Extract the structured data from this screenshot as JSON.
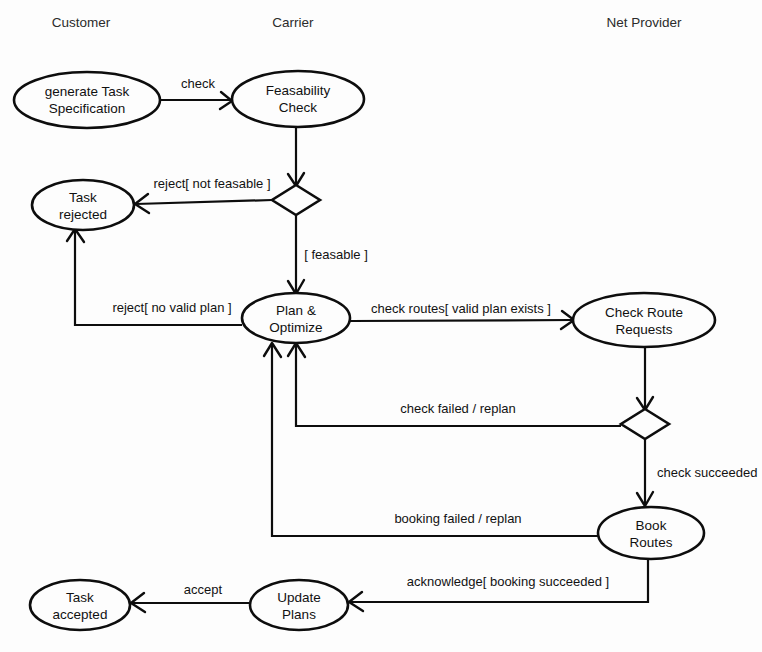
{
  "diagram": {
    "type": "uml-activity-state-diagram",
    "background_color": "#fdfdfd",
    "line_color": "#0d0d0d",
    "text_color": "#111111"
  },
  "lanes": [
    {
      "id": "lane-customer",
      "label": "Customer",
      "x": 81,
      "y": 27
    },
    {
      "id": "lane-carrier",
      "label": "Carrier",
      "x": 293,
      "y": 27
    },
    {
      "id": "lane-netprovider",
      "label": "Net Provider",
      "x": 644,
      "y": 27
    }
  ],
  "nodes": [
    {
      "id": "generate-task-specification",
      "shape": "ellipse",
      "lines": [
        "generate Task",
        "Specification"
      ],
      "cx": 87,
      "cy": 100,
      "rx": 73,
      "ry": 28
    },
    {
      "id": "feasability-check",
      "shape": "ellipse",
      "lines": [
        "Feasability",
        "Check"
      ],
      "cx": 298,
      "cy": 99,
      "rx": 66,
      "ry": 28
    },
    {
      "id": "task-rejected",
      "shape": "ellipse",
      "lines": [
        "Task",
        "rejected"
      ],
      "cx": 83,
      "cy": 205,
      "rx": 51,
      "ry": 25
    },
    {
      "id": "plan-and-optimize",
      "shape": "ellipse",
      "lines": [
        "Plan &",
        "Optimize"
      ],
      "cx": 296,
      "cy": 318,
      "rx": 54,
      "ry": 25
    },
    {
      "id": "check-route-requests",
      "shape": "ellipse",
      "lines": [
        "Check Route",
        "Requests"
      ],
      "cx": 644,
      "cy": 320,
      "rx": 71,
      "ry": 27
    },
    {
      "id": "book-routes",
      "shape": "ellipse",
      "lines": [
        "Book",
        "Routes"
      ],
      "cx": 651,
      "cy": 533,
      "rx": 53,
      "ry": 26
    },
    {
      "id": "update-plans",
      "shape": "ellipse",
      "lines": [
        "Update",
        "Plans"
      ],
      "cx": 299,
      "cy": 605,
      "rx": 49,
      "ry": 25
    },
    {
      "id": "task-accepted",
      "shape": "ellipse",
      "lines": [
        "Task",
        "accepted"
      ],
      "cx": 80,
      "cy": 605,
      "rx": 50,
      "ry": 25
    }
  ],
  "decisions": [
    {
      "id": "feasability-decision",
      "cx": 296,
      "cy": 200,
      "rx": 24,
      "ry": 15
    },
    {
      "id": "route-check-decision",
      "cx": 645,
      "cy": 424,
      "rx": 24,
      "ry": 15
    }
  ],
  "edges": [
    {
      "id": "edge-check",
      "from": "generate-task-specification",
      "to": "feasability-check",
      "label": "check",
      "label_x": 198,
      "label_y": 88,
      "label_anchor": "middle"
    },
    {
      "id": "edge-feasability-to-decision",
      "from": "feasability-check",
      "to": "feasability-decision",
      "label": "",
      "label_x": 0,
      "label_y": 0,
      "label_anchor": "middle"
    },
    {
      "id": "edge-reject-not-feasable",
      "from": "feasability-decision",
      "to": "task-rejected",
      "label": "reject[ not feasable ]",
      "label_x": 212,
      "label_y": 188,
      "label_anchor": "middle"
    },
    {
      "id": "edge-feasable",
      "from": "feasability-decision",
      "to": "plan-and-optimize",
      "label": "[ feasable ]",
      "label_x": 336,
      "label_y": 259,
      "label_anchor": "middle"
    },
    {
      "id": "edge-reject-no-valid-plan",
      "from": "plan-and-optimize",
      "to": "task-rejected",
      "label": "reject[ no valid plan ]",
      "label_x": 172,
      "label_y": 312,
      "label_anchor": "middle"
    },
    {
      "id": "edge-check-routes",
      "from": "plan-and-optimize",
      "to": "check-route-requests",
      "label": "check routes[ valid plan exists ]",
      "label_x": 461,
      "label_y": 313,
      "label_anchor": "middle"
    },
    {
      "id": "edge-requests-to-decision",
      "from": "check-route-requests",
      "to": "route-check-decision",
      "label": "",
      "label_x": 0,
      "label_y": 0,
      "label_anchor": "middle"
    },
    {
      "id": "edge-check-failed-replan",
      "from": "route-check-decision",
      "to": "plan-and-optimize",
      "label": "check failed / replan",
      "label_x": 458,
      "label_y": 413,
      "label_anchor": "middle"
    },
    {
      "id": "edge-check-succeeded",
      "from": "route-check-decision",
      "to": "book-routes",
      "label": "check succeeded",
      "label_x": 657,
      "label_y": 477,
      "label_anchor": "start"
    },
    {
      "id": "edge-booking-failed-replan",
      "from": "book-routes",
      "to": "plan-and-optimize",
      "label": "booking failed / replan",
      "label_x": 458,
      "label_y": 523,
      "label_anchor": "middle"
    },
    {
      "id": "edge-acknowledge",
      "from": "book-routes",
      "to": "update-plans",
      "label": "acknowledge[ booking succeeded ]",
      "label_x": 508,
      "label_y": 586,
      "label_anchor": "middle"
    },
    {
      "id": "edge-accept",
      "from": "update-plans",
      "to": "task-accepted",
      "label": "accept",
      "label_x": 203,
      "label_y": 594,
      "label_anchor": "middle"
    }
  ]
}
